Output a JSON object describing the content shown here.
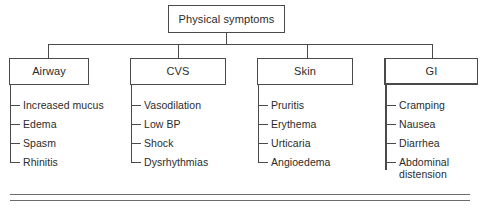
{
  "diagram": {
    "title": "Physical symptoms",
    "root": {
      "label": "Physical symptoms"
    },
    "branches": [
      {
        "label": "Airway",
        "emphasis": false,
        "items": [
          {
            "text": "Increased mucus",
            "wrap": false
          },
          {
            "text": "Edema",
            "wrap": false
          },
          {
            "text": "Spasm",
            "wrap": false
          },
          {
            "text": "Rhinitis",
            "wrap": false
          }
        ]
      },
      {
        "label": "CVS",
        "emphasis": false,
        "items": [
          {
            "text": "Vasodilation",
            "wrap": false
          },
          {
            "text": "Low BP",
            "wrap": false
          },
          {
            "text": "Shock",
            "wrap": false
          },
          {
            "text": "Dysrhythmias",
            "wrap": false
          }
        ]
      },
      {
        "label": "Skin",
        "emphasis": false,
        "items": [
          {
            "text": "Pruritis",
            "wrap": false
          },
          {
            "text": "Erythema",
            "wrap": false
          },
          {
            "text": "Urticaria",
            "wrap": false
          },
          {
            "text": "Angioedema",
            "wrap": false
          }
        ]
      },
      {
        "label": "GI",
        "emphasis": true,
        "items": [
          {
            "text": "Cramping",
            "wrap": false
          },
          {
            "text": "Nausea",
            "wrap": false
          },
          {
            "text": "Diarrhea",
            "wrap": false
          },
          {
            "text": "Abdominal distension",
            "wrap": true
          }
        ]
      }
    ],
    "colors": {
      "line": "#4a4a4a",
      "rule": "#6b6b6b",
      "text": "#2b2b2b",
      "background": "#ffffff"
    }
  }
}
